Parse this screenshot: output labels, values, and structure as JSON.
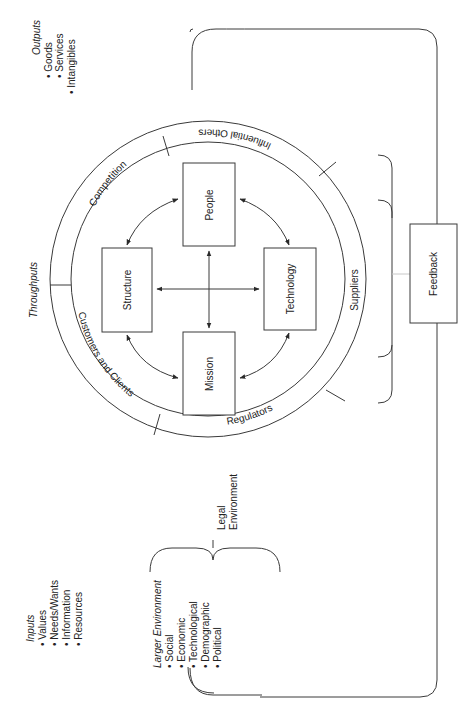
{
  "diagram": {
    "orientation": "rotated-90-clockwise",
    "core_elements": [
      {
        "id": "people",
        "label": "People"
      },
      {
        "id": "structure",
        "label": "Structure"
      },
      {
        "id": "technology",
        "label": "Technology"
      },
      {
        "id": "mission",
        "label": "Mission"
      }
    ],
    "ring_segments": [
      {
        "id": "influential-others",
        "label": "Influential Others"
      },
      {
        "id": "competition",
        "label": "Competition"
      },
      {
        "id": "customers-and-clients",
        "label": "Customers and Clients"
      },
      {
        "id": "regulators",
        "label": "Regulators"
      },
      {
        "id": "suppliers",
        "label": "Suppliers"
      }
    ],
    "throughputs_label": "Throughputs",
    "feedback_label": "Feedback",
    "legal_environment": {
      "line1": "Legal",
      "line2": "Environment"
    },
    "outputs": {
      "title": "Outputs",
      "items": [
        "• Goods",
        "• Services",
        "• Intangibles"
      ]
    },
    "inputs": {
      "title": "Inputs",
      "items": [
        "• Values",
        "• Needs/Wants",
        "• Information",
        "• Resources"
      ]
    },
    "larger_environment": {
      "title": "Larger Environment",
      "items": [
        "• Social",
        "• Economic",
        "• Technological",
        "• Demographic",
        "• Political"
      ]
    },
    "colors": {
      "line": "#3a3a3a",
      "text": "#222222",
      "background": "#ffffff"
    }
  }
}
